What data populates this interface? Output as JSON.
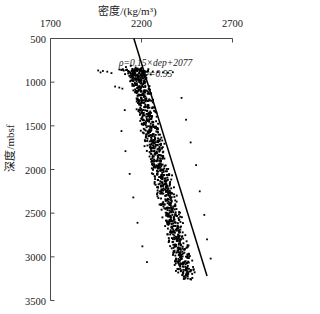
{
  "chart_data": {
    "type": "scatter",
    "title": "密度/(kg/m³)",
    "xlabel": "密度/(kg/m³)",
    "ylabel": "深度/mbsf",
    "x_axis_position": "top",
    "y_axis_inverted": true,
    "xlim": [
      1700,
      2700
    ],
    "ylim": [
      500,
      3500
    ],
    "xticks": [
      1700,
      2200,
      2700
    ],
    "xtick_labels": [
      "1700",
      "2200",
      "2700"
    ],
    "yticks": [
      500,
      1000,
      1500,
      2000,
      2500,
      3000,
      3500
    ],
    "ytick_labels": [
      "500",
      "1000",
      "1500",
      "2000",
      "2500",
      "3000",
      "3500"
    ],
    "grid": false,
    "legend": null,
    "marker_color": "#000000",
    "line_color": "#000000",
    "annotations": [
      {
        "id": "fit-equation",
        "text": "ρ=0.15×dep+2077",
        "x": 2450,
        "y": 790
      },
      {
        "id": "fit-r2",
        "text": "R²=0.95",
        "x": 2480,
        "y": 920
      }
    ],
    "fit": {
      "slope": 0.15,
      "intercept": 2077,
      "r_squared": 0.95,
      "equation": "ρ=0.15×dep+2077",
      "r2_label": "R²=0.95",
      "line_start": [
        2158,
        500
      ],
      "line_end": [
        2560,
        3220
      ]
    },
    "series": [
      {
        "name": "density-vs-depth",
        "depth_range": [
          850,
          3230
        ],
        "points": [
          [
            2167,
            852
          ],
          [
            2121,
            858
          ],
          [
            2184,
            860
          ],
          [
            2150,
            866
          ],
          [
            2205,
            870
          ],
          [
            2103,
            872
          ],
          [
            2178,
            876
          ],
          [
            2232,
            878
          ],
          [
            2160,
            882
          ],
          [
            2196,
            886
          ],
          [
            2141,
            890
          ],
          [
            2212,
            894
          ],
          [
            2173,
            898
          ],
          [
            2188,
            904
          ],
          [
            2155,
            910
          ],
          [
            2219,
            914
          ],
          [
            2180,
            920
          ],
          [
            2164,
            928
          ],
          [
            2201,
            934
          ],
          [
            2176,
            942
          ],
          [
            2193,
            950
          ],
          [
            2158,
            958
          ],
          [
            2210,
            964
          ],
          [
            2185,
            972
          ],
          [
            2171,
            980
          ],
          [
            2199,
            988
          ],
          [
            2163,
            996
          ],
          [
            2215,
            1004
          ],
          [
            2188,
            1012
          ],
          [
            2174,
            1022
          ],
          [
            2205,
            1030
          ],
          [
            2169,
            1040
          ],
          [
            2221,
            1048
          ],
          [
            2192,
            1058
          ],
          [
            2178,
            1068
          ],
          [
            2209,
            1076
          ],
          [
            2183,
            1086
          ],
          [
            2226,
            1096
          ],
          [
            2197,
            1106
          ],
          [
            2172,
            1116
          ],
          [
            2213,
            1126
          ],
          [
            2190,
            1136
          ],
          [
            2231,
            1146
          ],
          [
            2202,
            1156
          ],
          [
            2179,
            1168
          ],
          [
            2220,
            1178
          ],
          [
            2196,
            1190
          ],
          [
            2238,
            1200
          ],
          [
            2208,
            1212
          ],
          [
            2185,
            1224
          ],
          [
            2228,
            1234
          ],
          [
            2201,
            1246
          ],
          [
            2244,
            1258
          ],
          [
            2214,
            1270
          ],
          [
            2192,
            1282
          ],
          [
            2235,
            1292
          ],
          [
            2209,
            1304
          ],
          [
            2251,
            1316
          ],
          [
            2221,
            1328
          ],
          [
            2198,
            1340
          ],
          [
            2242,
            1352
          ],
          [
            2216,
            1364
          ],
          [
            2258,
            1376
          ],
          [
            2228,
            1388
          ],
          [
            2205,
            1400
          ],
          [
            2249,
            1412
          ],
          [
            2223,
            1424
          ],
          [
            2265,
            1436
          ],
          [
            2235,
            1448
          ],
          [
            2212,
            1460
          ],
          [
            2256,
            1472
          ],
          [
            2230,
            1484
          ],
          [
            2272,
            1496
          ],
          [
            2242,
            1508
          ],
          [
            2219,
            1520
          ],
          [
            2263,
            1532
          ],
          [
            2237,
            1544
          ],
          [
            2279,
            1556
          ],
          [
            2249,
            1568
          ],
          [
            2226,
            1580
          ],
          [
            2270,
            1592
          ],
          [
            2244,
            1604
          ],
          [
            2286,
            1616
          ],
          [
            2256,
            1628
          ],
          [
            2233,
            1640
          ],
          [
            2277,
            1652
          ],
          [
            2251,
            1664
          ],
          [
            2293,
            1676
          ],
          [
            2263,
            1688
          ],
          [
            2240,
            1700
          ],
          [
            2284,
            1712
          ],
          [
            2258,
            1724
          ],
          [
            2300,
            1736
          ],
          [
            2270,
            1748
          ],
          [
            2247,
            1760
          ],
          [
            2291,
            1772
          ],
          [
            2265,
            1784
          ],
          [
            2307,
            1796
          ],
          [
            2277,
            1808
          ],
          [
            2254,
            1820
          ],
          [
            2298,
            1832
          ],
          [
            2272,
            1844
          ],
          [
            2314,
            1856
          ],
          [
            2284,
            1868
          ],
          [
            2261,
            1880
          ],
          [
            2305,
            1892
          ],
          [
            2279,
            1904
          ],
          [
            2321,
            1916
          ],
          [
            2291,
            1928
          ],
          [
            2268,
            1940
          ],
          [
            2312,
            1952
          ],
          [
            2286,
            1964
          ],
          [
            2328,
            1976
          ],
          [
            2298,
            1988
          ],
          [
            2275,
            2000
          ],
          [
            2319,
            2012
          ],
          [
            2293,
            2024
          ],
          [
            2335,
            2036
          ],
          [
            2305,
            2048
          ],
          [
            2282,
            2060
          ],
          [
            2326,
            2072
          ],
          [
            2300,
            2084
          ],
          [
            2342,
            2096
          ],
          [
            2312,
            2108
          ],
          [
            2289,
            2120
          ],
          [
            2333,
            2132
          ],
          [
            2307,
            2144
          ],
          [
            2349,
            2156
          ],
          [
            2319,
            2168
          ],
          [
            2296,
            2180
          ],
          [
            2340,
            2192
          ],
          [
            2314,
            2204
          ],
          [
            2356,
            2216
          ],
          [
            2326,
            2228
          ],
          [
            2303,
            2240
          ],
          [
            2347,
            2252
          ],
          [
            2321,
            2264
          ],
          [
            2363,
            2276
          ],
          [
            2333,
            2288
          ],
          [
            2310,
            2300
          ],
          [
            2354,
            2312
          ],
          [
            2328,
            2324
          ],
          [
            2370,
            2336
          ],
          [
            2340,
            2348
          ],
          [
            2317,
            2360
          ],
          [
            2361,
            2372
          ],
          [
            2335,
            2384
          ],
          [
            2377,
            2396
          ],
          [
            2347,
            2408
          ],
          [
            2324,
            2420
          ],
          [
            2368,
            2432
          ],
          [
            2342,
            2444
          ],
          [
            2384,
            2456
          ],
          [
            2354,
            2468
          ],
          [
            2331,
            2480
          ],
          [
            2375,
            2492
          ],
          [
            2349,
            2504
          ],
          [
            2391,
            2516
          ],
          [
            2361,
            2528
          ],
          [
            2338,
            2540
          ],
          [
            2382,
            2552
          ],
          [
            2356,
            2564
          ],
          [
            2398,
            2576
          ],
          [
            2368,
            2588
          ],
          [
            2345,
            2600
          ],
          [
            2389,
            2612
          ],
          [
            2363,
            2624
          ],
          [
            2405,
            2636
          ],
          [
            2375,
            2648
          ],
          [
            2352,
            2660
          ],
          [
            2396,
            2672
          ],
          [
            2370,
            2684
          ],
          [
            2412,
            2696
          ],
          [
            2382,
            2708
          ],
          [
            2359,
            2720
          ],
          [
            2403,
            2732
          ],
          [
            2377,
            2744
          ],
          [
            2419,
            2756
          ],
          [
            2389,
            2768
          ],
          [
            2366,
            2780
          ],
          [
            2410,
            2792
          ],
          [
            2384,
            2804
          ],
          [
            2426,
            2816
          ],
          [
            2396,
            2828
          ],
          [
            2373,
            2840
          ],
          [
            2417,
            2852
          ],
          [
            2391,
            2864
          ],
          [
            2433,
            2876
          ],
          [
            2403,
            2888
          ],
          [
            2380,
            2900
          ],
          [
            2424,
            2912
          ],
          [
            2398,
            2924
          ],
          [
            2440,
            2936
          ],
          [
            2410,
            2948
          ],
          [
            2387,
            2960
          ],
          [
            2431,
            2972
          ],
          [
            2405,
            2984
          ],
          [
            2447,
            2996
          ],
          [
            2417,
            3008
          ],
          [
            2394,
            3020
          ],
          [
            2438,
            3032
          ],
          [
            2412,
            3044
          ],
          [
            2454,
            3056
          ],
          [
            2424,
            3068
          ],
          [
            2401,
            3080
          ],
          [
            2445,
            3092
          ],
          [
            2419,
            3104
          ],
          [
            2461,
            3116
          ],
          [
            2431,
            3128
          ],
          [
            2408,
            3140
          ],
          [
            2452,
            3152
          ],
          [
            2426,
            3164
          ],
          [
            2468,
            3176
          ],
          [
            2438,
            3188
          ],
          [
            2448,
            3200
          ],
          [
            2462,
            3212
          ],
          [
            2455,
            3224
          ]
        ],
        "outliers": [
          [
            1962,
            866
          ],
          [
            1988,
            872
          ],
          [
            2012,
            880
          ],
          [
            1975,
            888
          ],
          [
            2035,
            896
          ],
          [
            2262,
            878
          ],
          [
            2290,
            884
          ],
          [
            2318,
            888
          ],
          [
            2345,
            892
          ],
          [
            2372,
            886
          ],
          [
            2055,
            1050
          ],
          [
            2078,
            1062
          ],
          [
            2095,
            1074
          ],
          [
            2108,
            1320
          ],
          [
            2090,
            1560
          ],
          [
            2112,
            1790
          ],
          [
            2420,
            1180
          ],
          [
            2445,
            1430
          ],
          [
            2470,
            1690
          ],
          [
            2135,
            2050
          ],
          [
            2155,
            2320
          ],
          [
            2178,
            2610
          ],
          [
            2500,
            1950
          ],
          [
            2520,
            2250
          ],
          [
            2545,
            2520
          ],
          [
            2205,
            2880
          ],
          [
            2230,
            3060
          ],
          [
            2560,
            2800
          ],
          [
            2580,
            3020
          ]
        ]
      }
    ]
  }
}
